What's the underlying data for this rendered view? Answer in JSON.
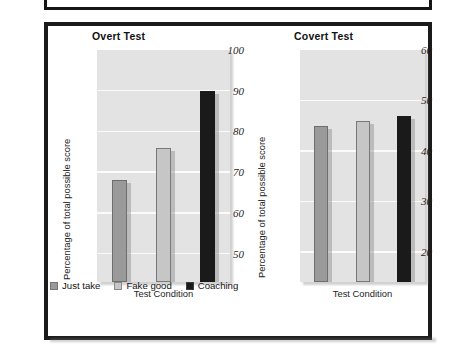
{
  "figure": {
    "ylabel": "Percentage of total possible score",
    "xlabel": "Test Condition"
  },
  "legend": {
    "items": [
      {
        "label": "Just take",
        "color": "#9a9a9a"
      },
      {
        "label": "Fake good",
        "color": "#c6c6c6"
      },
      {
        "label": "Coaching",
        "color": "#1a1a1a"
      }
    ]
  },
  "colors": {
    "plot_background": "#e3e3e3",
    "gridline": "#fbfbfb",
    "frame": "#1a1a1a",
    "just_take": "#9a9a9a",
    "fake_good": "#c6c6c6",
    "coaching": "#1a1a1a"
  },
  "chart_data": [
    {
      "type": "bar",
      "title": "Overt Test",
      "xlabel": "Test Condition",
      "ylabel": "Percentage of total possible score",
      "categories": [
        "Just take",
        "Fake good",
        "Coaching"
      ],
      "values": [
        68,
        76,
        90
      ],
      "ylim": [
        43,
        100
      ],
      "yticks": [
        50,
        60,
        70,
        80,
        90,
        100
      ],
      "ytick_labels": [
        "50",
        "60",
        "70",
        "80",
        "90",
        "100"
      ],
      "grid": true,
      "legend_position": "below-left"
    },
    {
      "type": "bar",
      "title": "Covert Test",
      "xlabel": "Test Condition",
      "ylabel": "Percentage of total possible score",
      "categories": [
        "Just take",
        "Fake good",
        "Coaching"
      ],
      "values": [
        45,
        46,
        47
      ],
      "ylim": [
        14,
        60
      ],
      "yticks": [
        20,
        30,
        40,
        50,
        60
      ],
      "ytick_labels": [
        "20",
        "30",
        "40",
        "50",
        "60"
      ],
      "grid": true,
      "legend_position": "below-left"
    }
  ]
}
